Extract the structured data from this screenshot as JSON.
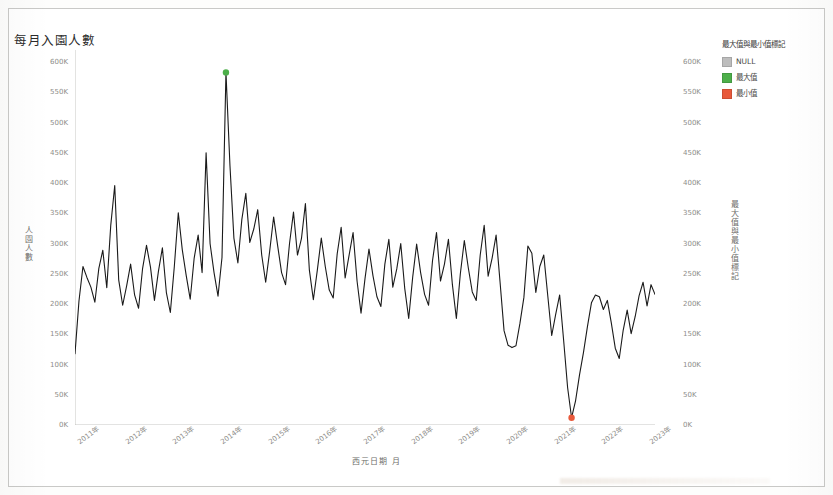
{
  "chart_data": {
    "type": "line",
    "title": "每月入園人數",
    "xlabel": "西元日期 月",
    "ylabel": "人園人數",
    "ylabel_right": "最大值與最小值標記",
    "ylim": [
      0,
      620000
    ],
    "yticks": [
      "0K",
      "50K",
      "100K",
      "150K",
      "200K",
      "250K",
      "300K",
      "350K",
      "400K",
      "450K",
      "500K",
      "550K",
      "600K"
    ],
    "ytick_values": [
      0,
      50000,
      100000,
      150000,
      200000,
      250000,
      300000,
      350000,
      400000,
      450000,
      500000,
      550000,
      600000
    ],
    "xticks": [
      "2011年",
      "2012年",
      "2013年",
      "2014年",
      "2015年",
      "2016年",
      "2017年",
      "2018年",
      "2019年",
      "2020年",
      "2021年",
      "2022年",
      "2023年"
    ],
    "grid": false,
    "legend_position": "top-right",
    "line_color": "#1a1a1a",
    "max_marker_color": "#4daf4a",
    "min_marker_color": "#e8593b",
    "max_point": {
      "x": "2013年12月",
      "y": 583000
    },
    "min_point": {
      "x": "2021年6月",
      "y": 12000
    },
    "series": [
      {
        "name": "每月入園人數",
        "values": [
          118000,
          205000,
          262000,
          244000,
          228000,
          203000,
          259000,
          289000,
          227000,
          330000,
          396000,
          240000,
          198000,
          230000,
          266000,
          215000,
          193000,
          258000,
          297000,
          261000,
          206000,
          254000,
          293000,
          219000,
          186000,
          262000,
          351000,
          290000,
          247000,
          208000,
          276000,
          314000,
          252000,
          450000,
          300000,
          252000,
          213000,
          277000,
          583000,
          430000,
          309000,
          268000,
          340000,
          383000,
          302000,
          324000,
          356000,
          281000,
          236000,
          287000,
          344000,
          297000,
          252000,
          232000,
          300000,
          352000,
          281000,
          308000,
          366000,
          256000,
          207000,
          256000,
          309000,
          262000,
          223000,
          210000,
          283000,
          327000,
          243000,
          281000,
          318000,
          238000,
          185000,
          242000,
          291000,
          247000,
          212000,
          196000,
          266000,
          307000,
          228000,
          258000,
          300000,
          226000,
          176000,
          244000,
          299000,
          252000,
          216000,
          198000,
          272000,
          318000,
          238000,
          266000,
          307000,
          232000,
          176000,
          250000,
          305000,
          260000,
          220000,
          206000,
          281000,
          330000,
          246000,
          276000,
          314000,
          236000,
          156000,
          132000,
          128000,
          131000,
          168000,
          211000,
          296000,
          284000,
          219000,
          262000,
          281000,
          214000,
          148000,
          183000,
          215000,
          140000,
          62000,
          12000,
          40000,
          83000,
          120000,
          163000,
          202000,
          215000,
          212000,
          191000,
          206000,
          169000,
          127000,
          110000,
          157000,
          190000,
          151000,
          179000,
          214000,
          236000,
          197000,
          232000,
          216000
        ]
      }
    ],
    "legend": {
      "title": "最大值與最小值標記",
      "items": [
        {
          "label": "NULL",
          "color": "#bdbdbd"
        },
        {
          "label": "最大值",
          "color": "#4daf4a"
        },
        {
          "label": "最小值",
          "color": "#e8593b"
        }
      ]
    }
  }
}
